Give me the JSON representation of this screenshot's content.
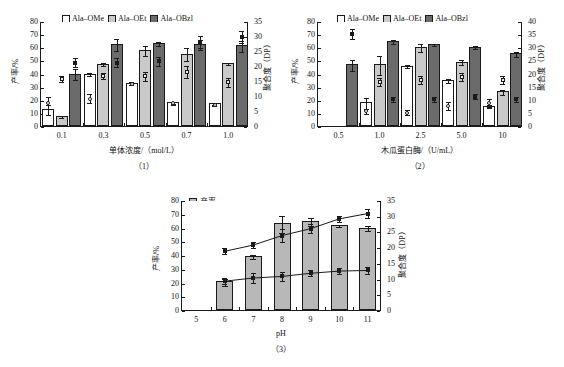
{
  "figure": {
    "panels": [
      "(1)",
      "(2)",
      "(3)"
    ]
  },
  "panel1": {
    "number": "（1）",
    "ylabel_left": "产率/%",
    "ylabel_right": "聚合度（DP）",
    "xlabel": "单体浓度/（mol/L）",
    "legend": [
      {
        "label": "Ala–OMe",
        "color": "#ffffff"
      },
      {
        "label": "Ala–OEt",
        "color": "#c9c9c9"
      },
      {
        "label": "Ala–OBzl",
        "color": "#6b6b6b"
      }
    ],
    "yticks_left": [
      "0",
      "10",
      "20",
      "30",
      "40",
      "50",
      "60",
      "70",
      "80"
    ],
    "yticks_right": [
      "0",
      "5",
      "10",
      "15",
      "20",
      "25",
      "30",
      "35"
    ],
    "xticks": [
      "0.1",
      "0.3",
      "0.5",
      "0.7",
      "1.0"
    ]
  },
  "panel2": {
    "number": "（2）",
    "ylabel_left": "产率/%",
    "ylabel_right": "聚合度（DP）",
    "xlabel": "木瓜蛋白酶/（U/mL）",
    "legend": [
      {
        "label": "Ala–OMe",
        "color": "#ffffff"
      },
      {
        "label": "Ala–OEt",
        "color": "#c9c9c9"
      },
      {
        "label": "Ala–OBzl",
        "color": "#6b6b6b"
      }
    ],
    "yticks_left": [
      "0",
      "10",
      "20",
      "30",
      "40",
      "50",
      "60",
      "70",
      "80"
    ],
    "yticks_right": [
      "0",
      "5",
      "10",
      "15",
      "20",
      "25",
      "30",
      "35",
      "40"
    ],
    "xticks": [
      "0.5",
      "1.0",
      "2.5",
      "5.0",
      "10"
    ]
  },
  "panel3": {
    "number": "（3）",
    "ylabel_left": "产率/%",
    "ylabel_right": "聚合度（DP）",
    "xlabel": "pH",
    "legend_bar": "产率",
    "legend_line1": "DP",
    "legend_line1_sub": "avg",
    "legend_line2": "DP",
    "legend_line2_sub": "max",
    "yticks_left": [
      "0",
      "10",
      "20",
      "30",
      "40",
      "50",
      "60",
      "70",
      "80"
    ],
    "yticks_right": [
      "0",
      "5",
      "10",
      "15",
      "20",
      "25",
      "30",
      "35"
    ],
    "xticks": [
      "5",
      "6",
      "7",
      "8",
      "9",
      "10",
      "11"
    ]
  },
  "chart_data": [
    {
      "type": "bar",
      "title": "(1) Effect of monomer concentration",
      "xlabel": "单体浓度/（mol/L）",
      "ylabel": "产率/%",
      "ylabel2": "聚合度（DP）",
      "ylim": [
        0,
        80
      ],
      "ylim2": [
        0,
        35
      ],
      "grid": false,
      "legend_position": "top",
      "categories": [
        "0.1",
        "0.3",
        "0.5",
        "0.7",
        "1.0"
      ],
      "series": [
        {
          "name": "Ala–OMe",
          "type": "bar",
          "color": "#ffffff",
          "values": [
            13,
            40,
            33,
            18,
            17.5
          ],
          "errors": [
            4,
            1.5,
            0.8,
            0.8,
            0.8
          ]
        },
        {
          "name": "Ala–OEt",
          "type": "bar",
          "color": "#c9c9c9",
          "values": [
            7.5,
            47.5,
            58,
            55,
            48
          ],
          "errors": [
            1,
            1,
            4,
            5,
            1
          ]
        },
        {
          "name": "Ala–OBzl",
          "type": "bar",
          "color": "#6b6b6b",
          "values": [
            40,
            62.5,
            63,
            62.5,
            61.5
          ],
          "errors": [
            4.5,
            4.5,
            1.5,
            4,
            4
          ]
        }
      ],
      "dp_markers": [
        {
          "name": "DP Ala–OMe",
          "marker": "open-circle",
          "axis": "right",
          "values": [
            8,
            9.5,
            14.5,
            8,
            7.5
          ],
          "errors": [
            2,
            1.5,
            0.5,
            0.5,
            0.5
          ]
        },
        {
          "name": "DP Ala–OEt",
          "marker": "open-square",
          "axis": "right",
          "values": [
            16,
            17,
            17,
            18.5,
            15
          ],
          "errors": [
            1,
            1,
            1.5,
            2,
            1.5
          ]
        },
        {
          "name": "DP Ala–OBzl",
          "marker": "filled-square",
          "axis": "right",
          "values": [
            21.5,
            21.5,
            22,
            28.5,
            30
          ],
          "errors": [
            1.5,
            1.5,
            1.5,
            2,
            2
          ]
        }
      ]
    },
    {
      "type": "bar",
      "title": "(2) Effect of papain concentration",
      "xlabel": "木瓜蛋白酶/（U/mL）",
      "ylabel": "产率/%",
      "ylabel2": "聚合度（DP）",
      "ylim": [
        0,
        80
      ],
      "ylim2": [
        0,
        40
      ],
      "grid": false,
      "legend_position": "top",
      "categories": [
        "0.5",
        "1.0",
        "2.5",
        "5.0",
        "10"
      ],
      "series": [
        {
          "name": "Ala–OMe",
          "type": "bar",
          "color": "#ffffff",
          "values": [
            null,
            18,
            46,
            35,
            15.5
          ],
          "errors": [
            null,
            4,
            1,
            1.5,
            1
          ]
        },
        {
          "name": "Ala–OEt",
          "type": "bar",
          "color": "#c9c9c9",
          "values": [
            null,
            47,
            60.5,
            49,
            26.5
          ],
          "errors": [
            null,
            7,
            3,
            2,
            2
          ]
        },
        {
          "name": "Ala–OBzl",
          "type": "bar",
          "color": "#6b6b6b",
          "values": [
            47,
            65,
            62.5,
            60.5,
            55.5
          ],
          "errors": [
            4,
            1.5,
            1,
            1,
            2
          ]
        }
      ],
      "dp_markers": [
        {
          "name": "DP Ala–OMe",
          "marker": "open-circle",
          "axis": "right",
          "values": [
            null,
            6,
            5.5,
            8,
            9
          ],
          "errors": [
            null,
            1,
            0.8,
            1.5,
            1.5
          ]
        },
        {
          "name": "DP Ala–OEt",
          "marker": "open-square",
          "axis": "right",
          "values": [
            null,
            17,
            18,
            19,
            18
          ],
          "errors": [
            null,
            1.5,
            1.5,
            1.5,
            1.5
          ]
        },
        {
          "name": "DP Ala–OBzl",
          "marker": "filled-square",
          "axis": "right",
          "values": [
            35.5,
            10.5,
            10.5,
            11.5,
            10.5
          ],
          "errors": [
            2,
            1,
            1,
            1,
            1
          ]
        }
      ]
    },
    {
      "type": "bar+line",
      "title": "(3) Effect of pH",
      "xlabel": "pH",
      "ylabel": "产率/%",
      "ylabel2": "聚合度（DP）",
      "ylim": [
        0,
        80
      ],
      "ylim2": [
        0,
        35
      ],
      "grid": false,
      "legend_position": "top-left",
      "categories": [
        "5",
        "6",
        "7",
        "8",
        "9",
        "10",
        "11"
      ],
      "series": [
        {
          "name": "产率",
          "type": "bar",
          "color": "#b8b8b8",
          "axis": "left",
          "values": [
            null,
            21,
            39,
            63,
            65,
            62,
            60
          ],
          "errors": [
            null,
            2.5,
            1.5,
            6,
            3,
            0.8,
            2
          ]
        },
        {
          "name": "DPavg",
          "type": "line",
          "marker": "filled-square",
          "axis": "right",
          "values": [
            null,
            9.5,
            10.5,
            11,
            12,
            12.7,
            12.9
          ],
          "errors": [
            null,
            1,
            1.5,
            1.5,
            1,
            1,
            1
          ]
        },
        {
          "name": "DPmax",
          "type": "line",
          "marker": "filled-square",
          "axis": "right",
          "values": [
            null,
            19,
            21,
            24,
            26.2,
            29.3,
            31
          ],
          "errors": [
            null,
            1,
            1,
            2,
            1.5,
            1,
            1.5
          ]
        }
      ]
    }
  ]
}
